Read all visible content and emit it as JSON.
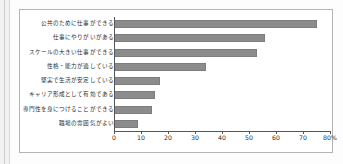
{
  "chart_data": {
    "type": "bar",
    "orientation": "horizontal",
    "title": "",
    "xlabel": "",
    "ylabel": "",
    "xlim": [
      0,
      80
    ],
    "xtick_step": 10,
    "grid": false,
    "legend": "none",
    "axis_unit_suffix": "%",
    "bar_color": "#8c8c8c",
    "categories": [
      "公共のために仕事ができる",
      "仕事にやりがいがある",
      "スケールの大きい仕事ができる",
      "性格・能力が適している",
      "堅実で生活が安定している",
      "キャリア形成として有効である",
      "専門性を身につけることができる",
      "職場の雰囲気がよい"
    ],
    "values": [
      75,
      56,
      53,
      34,
      17,
      15,
      14,
      9
    ],
    "tick_labels": [
      "0",
      "10",
      "20",
      "30",
      "40",
      "50",
      "60",
      "70",
      "80%"
    ],
    "tick_values": [
      0,
      10,
      20,
      30,
      40,
      50,
      60,
      70,
      80
    ]
  }
}
